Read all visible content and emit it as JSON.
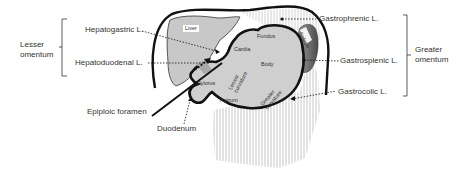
{
  "diagram": {
    "groups": {
      "lesser_omentum": "Lesser omentum",
      "lesser_omentum_line1": "Lesser",
      "lesser_omentum_line2": "omentum",
      "greater_omentum_line1": "Greater",
      "greater_omentum_line2": "omentum"
    },
    "ligaments": {
      "hepatogastric": "Hepatogastric L.",
      "hepatoduodenal": "Hepatoduodenal  L.",
      "gastrophrenic": "Gastrophrenic L.",
      "gastrosplenic": "Gastrosplenic L.",
      "gastrocolic": "Gastrocolic L."
    },
    "structures": {
      "epiploic_foramen": "Epiploic foramen",
      "duodenum": "Duodenum",
      "liver": "Liver",
      "spleen": "Spleen"
    },
    "stomach_regions": {
      "fundus": "Fundus",
      "cardia": "Cardia",
      "body": "Body",
      "pylorus": "Pylorus",
      "antrum": "Antrum",
      "lesser_curvature_1": "Lesser",
      "lesser_curvature_2": "curvature",
      "greater_curvature_1": "Greater",
      "greater_curvature_2": "curvature"
    },
    "colors": {
      "outline": "#111111",
      "organ_fill": "#cfcfcf",
      "liver_fill": "#c8c8c8",
      "spleen_fill": "#555555",
      "omentum_stripes": "#bbbbbb",
      "text": "#333333"
    }
  }
}
